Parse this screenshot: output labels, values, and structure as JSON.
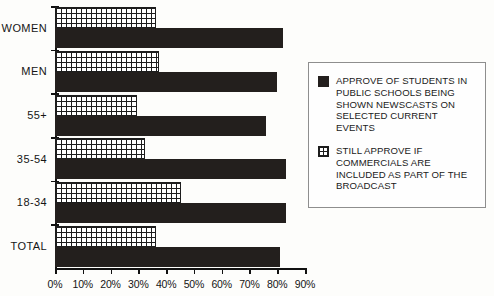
{
  "chart_data": {
    "type": "bar",
    "orientation": "horizontal",
    "title": "",
    "xlabel": "",
    "ylabel": "",
    "xlim": [
      0,
      90
    ],
    "grid": false,
    "legend_position": "right",
    "tick_labels": [
      "0%",
      "10%",
      "20%",
      "30%",
      "40%",
      "50%",
      "60%",
      "70%",
      "80%",
      "90%"
    ],
    "tick_values": [
      0,
      10,
      20,
      30,
      40,
      50,
      60,
      70,
      80,
      90
    ],
    "categories": [
      "WOMEN",
      "MEN",
      "55+",
      "35-54",
      "18-34",
      "TOTAL"
    ],
    "series": [
      {
        "name": "APPROVE OF STUDENTS IN PUBLIC SCHOOLS BEING SHOWN NEWSCASTS ON SELECTED CURRENT EVENTS",
        "pattern": "solid",
        "color": "#231f1d",
        "values": [
          82,
          80,
          76,
          83,
          83,
          81
        ]
      },
      {
        "name": "STILL APPROVE IF COMMERCIALS ARE INCLUDED AS PART OF THE BROADCAST",
        "pattern": "grid",
        "color": "#ffffff",
        "values": [
          36,
          37,
          29,
          32,
          45,
          36
        ]
      }
    ]
  },
  "legend": {
    "entries": [
      {
        "label": "APPROVE OF STUDENTS IN\nPUBLIC SCHOOLS BEING\nSHOWN NEWSCASTS ON\nSELECTED CURRENT\nEVENTS"
      },
      {
        "label": "STILL APPROVE IF\nCOMMERCIALS ARE\nINCLUDED AS PART OF THE\nBROADCAST"
      }
    ]
  }
}
